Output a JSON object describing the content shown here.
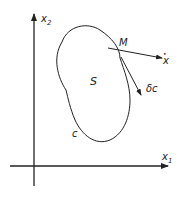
{
  "diagram": {
    "axes": {
      "x_label": "x",
      "x_sub": "1",
      "y_label": "x",
      "y_sub": "2"
    },
    "region_label": "S",
    "curve_label": "c",
    "point_label": "M",
    "vectors": {
      "velocity_label": "x",
      "velocity_accent": "•",
      "variation_label": "δc"
    },
    "colors": {
      "stroke": "#222222",
      "background": "#ffffff"
    }
  }
}
